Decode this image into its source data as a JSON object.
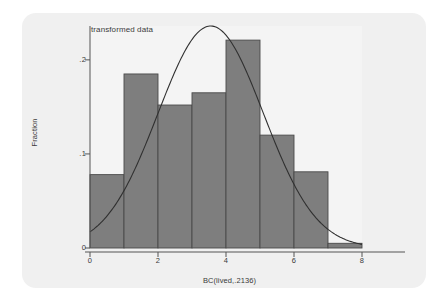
{
  "figure": {
    "title": "transformed data",
    "panel_bg": "#f0f0f0",
    "plot_bg": "#f4f4f4",
    "bar_fill": "#7e7e7e",
    "bar_edge": "#4a4a4a",
    "axis_color": "#555555",
    "curve_color": "#303030"
  },
  "axes": {
    "ylabel": "Fraction",
    "xlabel": "BC(lived,.2136)",
    "yticks": [
      "0",
      ".1",
      ".2"
    ],
    "ytick_values": [
      0,
      0.1,
      0.2
    ],
    "xticks": [
      "0",
      "2",
      "4",
      "6",
      "8"
    ],
    "xtick_values": [
      0,
      2,
      4,
      6,
      8
    ]
  },
  "chart_data": {
    "type": "bar",
    "title": "transformed data",
    "subtitle": "",
    "xlabel": "BC(lived,.2136)",
    "ylabel": "Fraction",
    "xlim": [
      0,
      8
    ],
    "ylim": [
      0,
      0.236
    ],
    "grid": false,
    "legend": null,
    "bin_width": 1,
    "bin_edges": [
      0,
      1,
      2,
      3,
      4,
      5,
      6,
      7,
      8
    ],
    "categories": [
      "0-1",
      "1-2",
      "2-3",
      "3-4",
      "4-5",
      "5-6",
      "6-7",
      "7-8"
    ],
    "bin_centers": [
      0.5,
      1.5,
      2.5,
      3.5,
      4.5,
      5.5,
      6.5,
      7.5
    ],
    "values": [
      0.078,
      0.185,
      0.152,
      0.165,
      0.221,
      0.12,
      0.081,
      0.005
    ],
    "series": [
      {
        "name": "Fraction",
        "type": "bar",
        "values": [
          0.078,
          0.185,
          0.152,
          0.165,
          0.221,
          0.12,
          0.081,
          0.005
        ]
      },
      {
        "name": "normal density overlay",
        "type": "line",
        "mean": 3.55,
        "sd": 1.55,
        "peak_value": 0.236,
        "x_start": 0.0,
        "y_start": 0.022,
        "x_end": 8.0,
        "y_end": 0.007
      }
    ]
  }
}
